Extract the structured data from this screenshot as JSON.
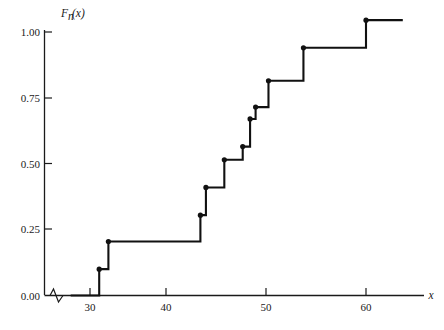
{
  "chart_data": {
    "type": "line",
    "subtype": "step-ecdf",
    "title": "",
    "xlabel": "x",
    "ylabel": "F_n(x)",
    "ylabel_display": "Fn(x)",
    "xlim": [
      27.5,
      64.5
    ],
    "ylim": [
      0.0,
      1.06
    ],
    "grid": false,
    "legend": null,
    "x_ticks": [
      30,
      40,
      50,
      60
    ],
    "x_tick_labels": [
      "30",
      "40",
      "50",
      "60"
    ],
    "y_ticks": [
      0.0,
      0.25,
      0.5,
      0.75,
      1.0
    ],
    "y_tick_labels": [
      "0.00",
      "0.25",
      "0.50",
      "0.75",
      "1.00"
    ],
    "axis_break": {
      "present": true,
      "axis": "x",
      "symbol": "zigzag",
      "near_value": 29.0
    },
    "step_points": [
      {
        "x": 31.0,
        "y": 0.1
      },
      {
        "x": 32.0,
        "y": 0.205
      },
      {
        "x": 42.0,
        "y": 0.305
      },
      {
        "x": 42.6,
        "y": 0.41
      },
      {
        "x": 44.6,
        "y": 0.515
      },
      {
        "x": 46.6,
        "y": 0.565
      },
      {
        "x": 47.4,
        "y": 0.67
      },
      {
        "x": 48.0,
        "y": 0.715
      },
      {
        "x": 49.4,
        "y": 0.815
      },
      {
        "x": 53.2,
        "y": 0.94
      },
      {
        "x": 60.0,
        "y": 1.045
      }
    ],
    "step_start": {
      "x": 27.9,
      "y": 0.0
    },
    "step_end": {
      "x": 64.0,
      "y": 1.045
    },
    "series_color": "#111111",
    "axis_color": "#1a1a1a",
    "background_color": "#ffffff"
  },
  "axes": {
    "y_axis_title": "F",
    "y_axis_title_sub": "n",
    "y_axis_title_arg": "(x)",
    "x_axis_title": "x"
  },
  "y_tick_items": [
    {
      "label": "1.00",
      "value": 1.0
    },
    {
      "label": "0.75",
      "value": 0.75
    },
    {
      "label": "0.50",
      "value": 0.5
    },
    {
      "label": "0.25",
      "value": 0.25
    },
    {
      "label": "0.00",
      "value": 0.0
    }
  ],
  "x_tick_items": [
    {
      "label": "30",
      "value": 30
    },
    {
      "label": "40",
      "value": 40
    },
    {
      "label": "50",
      "value": 50
    },
    {
      "label": "60",
      "value": 60
    }
  ]
}
